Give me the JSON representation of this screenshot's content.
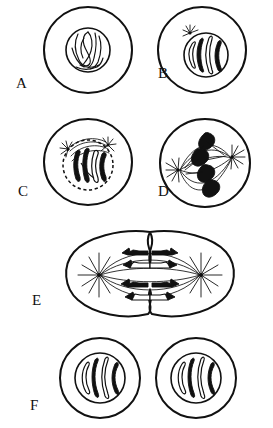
{
  "figure": {
    "background_color": "#ffffff",
    "ink_color": "#111111",
    "width": 273,
    "height": 428
  },
  "panels": [
    {
      "id": "A",
      "label": "A",
      "stage_name": "Interphase / Early Prophase",
      "caption": "Cell with intact nucleus containing tangled chromatin threads",
      "label_x": 16,
      "label_y": 88,
      "cell": {
        "cx": 88,
        "cy": 50,
        "rx": 44,
        "ry": 43
      },
      "nucleus": {
        "cx": 88,
        "cy": 50,
        "r": 22
      },
      "chromosome_count": 0,
      "chromatin_threads": 5,
      "has_asters": false,
      "has_spindle": false,
      "nuclear_envelope_intact": true
    },
    {
      "id": "B",
      "label": "B",
      "stage_name": "Prophase",
      "caption": "Chromosomes condense and become visible; one aster appears beside the nucleus",
      "label_x": 158,
      "label_y": 78,
      "cell": {
        "cx": 202,
        "cy": 50,
        "rx": 44,
        "ry": 43
      },
      "nucleus": {
        "cx": 206,
        "cy": 55,
        "r": 22
      },
      "chromosome_count": 4,
      "chromatin_threads": 0,
      "has_asters": true,
      "aster_count": 1,
      "has_spindle": false,
      "nuclear_envelope_intact": true
    },
    {
      "id": "C",
      "label": "C",
      "stage_name": "Late Prophase / Prometaphase",
      "caption": "Nuclear envelope breaks down (dashed outline); two asters form with spindle fibers",
      "label_x": 18,
      "label_y": 196,
      "cell": {
        "cx": 88,
        "cy": 162,
        "rx": 44,
        "ry": 43
      },
      "nucleus": {
        "cx": 88,
        "cy": 165,
        "r": 25
      },
      "chromosome_count": 4,
      "chromatin_threads": 0,
      "has_asters": true,
      "aster_count": 2,
      "has_spindle": true,
      "nuclear_envelope_intact": false
    },
    {
      "id": "D",
      "label": "D",
      "stage_name": "Metaphase",
      "caption": "Spindle fully formed between two poles; chromosomes aligned on the metaphase plate",
      "label_x": 158,
      "label_y": 196,
      "cell": {
        "cx": 205,
        "cy": 163,
        "rx": 45,
        "ry": 44
      },
      "nucleus": null,
      "chromosome_count": 4,
      "chromatin_threads": 0,
      "has_asters": true,
      "aster_count": 2,
      "has_spindle": true,
      "nuclear_envelope_intact": false
    },
    {
      "id": "E",
      "label": "E",
      "stage_name": "Anaphase / Telophase",
      "caption": "Sister chromatids pulled to opposite poles; cleavage furrow pinches the cell",
      "label_x": 32,
      "label_y": 305,
      "cell": {
        "cx": 150,
        "cy": 275,
        "rx": 82,
        "ry": 45
      },
      "nucleus": null,
      "chromosome_count": 8,
      "chromatin_threads": 0,
      "has_asters": true,
      "aster_count": 2,
      "has_spindle": true,
      "nuclear_envelope_intact": false,
      "cleavage_furrow": true
    },
    {
      "id": "F",
      "label": "F",
      "stage_name": "Daughter Cells",
      "caption": "Two identical daughter cells, each with a re-formed nucleus of four chromosomes",
      "label_x": 30,
      "label_y": 410,
      "cells": [
        {
          "cx": 100,
          "cy": 378,
          "rx": 40,
          "ry": 40,
          "nucleus": {
            "cx": 100,
            "cy": 378,
            "r": 25
          },
          "chromosome_count": 4
        },
        {
          "cx": 196,
          "cy": 378,
          "rx": 40,
          "ry": 40,
          "nucleus": {
            "cx": 196,
            "cy": 378,
            "r": 25
          },
          "chromosome_count": 4
        }
      ],
      "has_asters": false,
      "has_spindle": false,
      "nuclear_envelope_intact": true
    }
  ],
  "legend_keys": {
    "cell_membrane": "cell-membrane",
    "nuclear_envelope": "nuclear-envelope",
    "chromosome_open": "chromosome-open",
    "chromosome_solid": "chromosome-solid",
    "aster": "aster-icon",
    "spindle": "spindle-fiber",
    "centrosome": "centrosome-dot"
  }
}
